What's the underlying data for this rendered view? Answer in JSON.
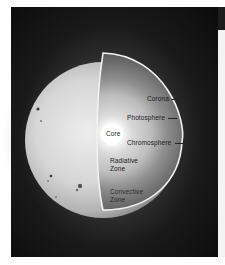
{
  "diagram": {
    "labels": {
      "corona": "Corona",
      "photosphere": "Photosphere",
      "chromosphere": "Chromosphere",
      "core": "Core",
      "radiative_zone_line1": "Radiative",
      "radiative_zone_line2": "Zone",
      "convective_zone_line1": "Convective",
      "convective_zone_line2": "Zone"
    },
    "colors": {
      "background": "#0b0b0b",
      "sphere_surface": "#d8d8d8",
      "core": "#ffffff",
      "cutaway_outline": "#f2f2f2",
      "label_text": "#1a1a1a"
    }
  }
}
